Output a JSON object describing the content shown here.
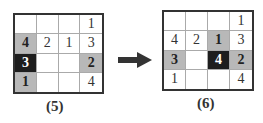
{
  "panels": [
    {
      "label": "(5)",
      "cells": [
        [
          {
            "v": "",
            "s": ""
          },
          {
            "v": "",
            "s": ""
          },
          {
            "v": "",
            "s": ""
          },
          {
            "v": "1",
            "s": ""
          }
        ],
        [
          {
            "v": "4",
            "s": "gray"
          },
          {
            "v": "2",
            "s": ""
          },
          {
            "v": "1",
            "s": ""
          },
          {
            "v": "3",
            "s": ""
          }
        ],
        [
          {
            "v": "3",
            "s": "black"
          },
          {
            "v": "",
            "s": ""
          },
          {
            "v": "",
            "s": ""
          },
          {
            "v": "2",
            "s": "gray"
          }
        ],
        [
          {
            "v": "1",
            "s": "gray"
          },
          {
            "v": "",
            "s": ""
          },
          {
            "v": "",
            "s": ""
          },
          {
            "v": "4",
            "s": ""
          }
        ]
      ]
    },
    {
      "label": "(6)",
      "cells": [
        [
          {
            "v": "",
            "s": ""
          },
          {
            "v": "",
            "s": ""
          },
          {
            "v": "",
            "s": ""
          },
          {
            "v": "1",
            "s": ""
          }
        ],
        [
          {
            "v": "4",
            "s": ""
          },
          {
            "v": "2",
            "s": ""
          },
          {
            "v": "1",
            "s": "gray"
          },
          {
            "v": "3",
            "s": ""
          }
        ],
        [
          {
            "v": "3",
            "s": "gray"
          },
          {
            "v": "",
            "s": ""
          },
          {
            "v": "4",
            "s": "black"
          },
          {
            "v": "2",
            "s": "gray"
          }
        ],
        [
          {
            "v": "1",
            "s": ""
          },
          {
            "v": "",
            "s": ""
          },
          {
            "v": "",
            "s": ""
          },
          {
            "v": "4",
            "s": ""
          }
        ]
      ]
    }
  ],
  "arrow": {
    "icon": "right-arrow-icon",
    "color": "#333333"
  },
  "colors": {
    "gray": "#b8b8b8",
    "black": "#1e1e1e",
    "border": "#333333"
  }
}
